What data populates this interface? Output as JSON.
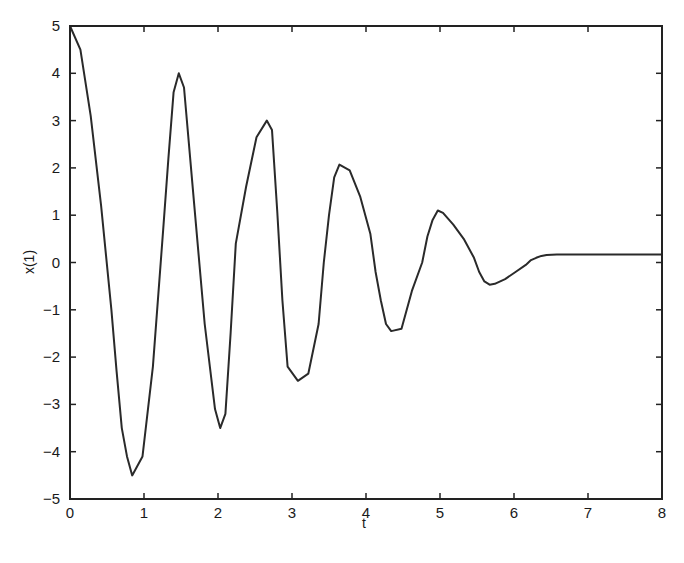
{
  "chart_data": {
    "type": "line",
    "title": "",
    "xlabel": "t",
    "ylabel": "x(1)",
    "xlim": [
      0,
      8
    ],
    "ylim": [
      -5,
      5
    ],
    "xticks": [
      0,
      1,
      2,
      3,
      4,
      5,
      6,
      7,
      8
    ],
    "yticks": [
      -5,
      -4,
      -3,
      -2,
      -1,
      0,
      1,
      2,
      3,
      4,
      5
    ],
    "grid": false,
    "legend": null,
    "series": [
      {
        "name": "x(1)",
        "color": "#2a2a2a",
        "x": [
          0,
          0.14,
          0.28,
          0.42,
          0.56,
          0.63,
          0.7,
          0.77,
          0.84,
          0.98,
          1.12,
          1.26,
          1.33,
          1.4,
          1.47,
          1.54,
          1.68,
          1.82,
          1.96,
          2.03,
          2.1,
          2.17,
          2.24,
          2.38,
          2.52,
          2.66,
          2.73,
          2.8,
          2.87,
          2.94,
          3.08,
          3.22,
          3.36,
          3.43,
          3.5,
          3.57,
          3.64,
          3.78,
          3.92,
          4.06,
          4.13,
          4.2,
          4.27,
          4.34,
          4.48,
          4.62,
          4.76,
          4.83,
          4.9,
          4.97,
          5.04,
          5.18,
          5.32,
          5.46,
          5.53,
          5.6,
          5.67,
          5.74,
          5.88,
          6.02,
          6.16,
          6.23,
          6.3,
          6.37,
          6.44,
          6.58,
          6.72,
          6.86,
          7.0,
          7.14,
          7.28,
          7.5,
          8.0
        ],
        "y": [
          5.0,
          4.5,
          3.1,
          1.2,
          -1.0,
          -2.3,
          -3.5,
          -4.1,
          -4.5,
          -4.1,
          -2.2,
          0.7,
          2.2,
          3.6,
          4.0,
          3.7,
          1.2,
          -1.3,
          -3.1,
          -3.5,
          -3.2,
          -1.5,
          0.4,
          1.6,
          2.65,
          3.0,
          2.8,
          1.1,
          -0.8,
          -2.2,
          -2.5,
          -2.35,
          -1.3,
          0.0,
          1.0,
          1.8,
          2.07,
          1.95,
          1.4,
          0.6,
          -0.2,
          -0.8,
          -1.3,
          -1.45,
          -1.4,
          -0.6,
          0.0,
          0.55,
          0.9,
          1.1,
          1.05,
          0.8,
          0.5,
          0.1,
          -0.2,
          -0.4,
          -0.47,
          -0.45,
          -0.35,
          -0.2,
          -0.05,
          0.05,
          0.1,
          0.14,
          0.16,
          0.17,
          0.17,
          0.17,
          0.17,
          0.17,
          0.17,
          0.17,
          0.17
        ]
      }
    ]
  }
}
